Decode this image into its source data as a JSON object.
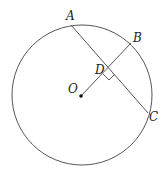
{
  "diagram": {
    "colors": {
      "stroke": "#555555",
      "text": "#222222",
      "background": "#ffffff"
    },
    "circle": {
      "center_label": "O",
      "cx": 82,
      "cy": 95,
      "r": 70
    },
    "points": {
      "A": {
        "label": "A",
        "x": 71,
        "y": 25
      },
      "B": {
        "label": "B",
        "x": 131,
        "y": 43
      },
      "C": {
        "label": "C",
        "x": 148,
        "y": 113
      },
      "D": {
        "label": "D",
        "x": 108,
        "y": 68
      },
      "O": {
        "label": "O",
        "x": 81,
        "y": 96
      }
    },
    "segments": [
      "AC",
      "OB"
    ],
    "annotations": [
      "right angle at D"
    ]
  }
}
